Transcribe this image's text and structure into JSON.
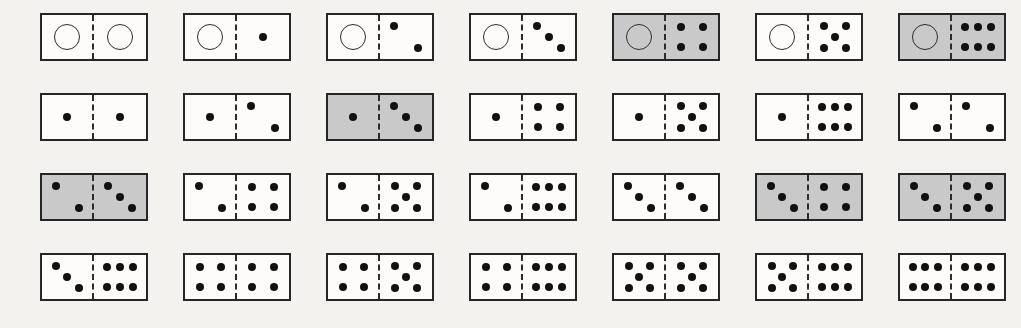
{
  "figure": {
    "rows": 4,
    "columns": 7,
    "total_tiles": 28,
    "colors": {
      "background": "#f3f2ef",
      "tile_face": "#fdfcfa",
      "tile_face_shaded": "#c9c9c9",
      "border": "#262626",
      "pip": "#111111",
      "zero_ring": "#2d2d2d"
    },
    "layout": {
      "tile_width": 108,
      "tile_height": 48,
      "column_step": 143,
      "row_step": 80,
      "origin_x": 40,
      "origin_y": 13
    },
    "legend": {
      "zero_symbol": "open-circle",
      "pip_symbol": "filled-dot",
      "shaded_meaning": "highlighted tile"
    }
  },
  "chart_data": {
    "type": "table",
    "categories": [
      "row 1",
      "row 2",
      "row 3",
      "row 4"
    ],
    "tiles": [
      {
        "id": "d-0-0",
        "row": 0,
        "col": 0,
        "left": 0,
        "right": 0,
        "shaded": false,
        "label": "0-0"
      },
      {
        "id": "d-0-1",
        "row": 0,
        "col": 1,
        "left": 0,
        "right": 1,
        "shaded": false,
        "label": "0-1"
      },
      {
        "id": "d-0-2",
        "row": 0,
        "col": 2,
        "left": 0,
        "right": 2,
        "shaded": false,
        "label": "0-2"
      },
      {
        "id": "d-0-3",
        "row": 0,
        "col": 3,
        "left": 0,
        "right": 3,
        "shaded": false,
        "label": "0-3"
      },
      {
        "id": "d-0-4",
        "row": 0,
        "col": 4,
        "left": 0,
        "right": 4,
        "shaded": true,
        "label": "0-4"
      },
      {
        "id": "d-0-5",
        "row": 0,
        "col": 5,
        "left": 0,
        "right": 5,
        "shaded": false,
        "label": "0-5"
      },
      {
        "id": "d-0-6",
        "row": 0,
        "col": 6,
        "left": 0,
        "right": 6,
        "shaded": true,
        "label": "0-6"
      },
      {
        "id": "d-1-1",
        "row": 1,
        "col": 0,
        "left": 1,
        "right": 1,
        "shaded": false,
        "label": "1-1"
      },
      {
        "id": "d-1-2",
        "row": 1,
        "col": 1,
        "left": 1,
        "right": 2,
        "shaded": false,
        "label": "1-2"
      },
      {
        "id": "d-1-3",
        "row": 1,
        "col": 2,
        "left": 1,
        "right": 3,
        "shaded": true,
        "label": "1-3"
      },
      {
        "id": "d-1-4",
        "row": 1,
        "col": 3,
        "left": 1,
        "right": 4,
        "shaded": false,
        "label": "1-4"
      },
      {
        "id": "d-1-5",
        "row": 1,
        "col": 4,
        "left": 1,
        "right": 5,
        "shaded": false,
        "label": "1-5"
      },
      {
        "id": "d-1-6",
        "row": 1,
        "col": 5,
        "left": 1,
        "right": 6,
        "shaded": false,
        "label": "1-6"
      },
      {
        "id": "d-2-2",
        "row": 1,
        "col": 6,
        "left": 2,
        "right": 2,
        "shaded": false,
        "label": "2-2"
      },
      {
        "id": "d-2-3",
        "row": 2,
        "col": 0,
        "left": 2,
        "right": 3,
        "shaded": true,
        "label": "2-3"
      },
      {
        "id": "d-2-4",
        "row": 2,
        "col": 1,
        "left": 2,
        "right": 4,
        "shaded": false,
        "label": "2-4"
      },
      {
        "id": "d-2-5",
        "row": 2,
        "col": 2,
        "left": 2,
        "right": 5,
        "shaded": false,
        "label": "2-5"
      },
      {
        "id": "d-2-6",
        "row": 2,
        "col": 3,
        "left": 2,
        "right": 6,
        "shaded": false,
        "label": "2-6"
      },
      {
        "id": "d-3-3",
        "row": 2,
        "col": 4,
        "left": 3,
        "right": 3,
        "shaded": false,
        "label": "3-3"
      },
      {
        "id": "d-3-4",
        "row": 2,
        "col": 5,
        "left": 3,
        "right": 4,
        "shaded": true,
        "label": "3-4"
      },
      {
        "id": "d-3-5",
        "row": 2,
        "col": 6,
        "left": 3,
        "right": 5,
        "shaded": true,
        "label": "3-5"
      },
      {
        "id": "d-3-6",
        "row": 3,
        "col": 0,
        "left": 3,
        "right": 6,
        "shaded": false,
        "label": "3-6"
      },
      {
        "id": "d-4-4",
        "row": 3,
        "col": 1,
        "left": 4,
        "right": 4,
        "shaded": false,
        "label": "4-4"
      },
      {
        "id": "d-4-5",
        "row": 3,
        "col": 2,
        "left": 4,
        "right": 5,
        "shaded": false,
        "label": "4-5"
      },
      {
        "id": "d-4-6",
        "row": 3,
        "col": 3,
        "left": 4,
        "right": 6,
        "shaded": false,
        "label": "4-6"
      },
      {
        "id": "d-5-5",
        "row": 3,
        "col": 4,
        "left": 5,
        "right": 5,
        "shaded": false,
        "label": "5-5"
      },
      {
        "id": "d-5-6",
        "row": 3,
        "col": 5,
        "left": 5,
        "right": 6,
        "shaded": false,
        "label": "5-6"
      },
      {
        "id": "d-6-6",
        "row": 3,
        "col": 6,
        "left": 6,
        "right": 6,
        "shaded": false,
        "label": "6-6"
      }
    ],
    "pip_positions": {
      "0": [],
      "1": [
        [
          50,
          50
        ]
      ],
      "2": [
        [
          27,
          26
        ],
        [
          73,
          74
        ]
      ],
      "3": [
        [
          27,
          24
        ],
        [
          50,
          50
        ],
        [
          73,
          76
        ]
      ],
      "4": [
        [
          29,
          27
        ],
        [
          71,
          27
        ],
        [
          29,
          73
        ],
        [
          71,
          73
        ]
      ],
      "5": [
        [
          29,
          26
        ],
        [
          71,
          26
        ],
        [
          50,
          50
        ],
        [
          29,
          74
        ],
        [
          71,
          74
        ]
      ],
      "6": [
        [
          25,
          27
        ],
        [
          50,
          27
        ],
        [
          75,
          27
        ],
        [
          25,
          73
        ],
        [
          50,
          73
        ],
        [
          75,
          73
        ]
      ]
    }
  }
}
